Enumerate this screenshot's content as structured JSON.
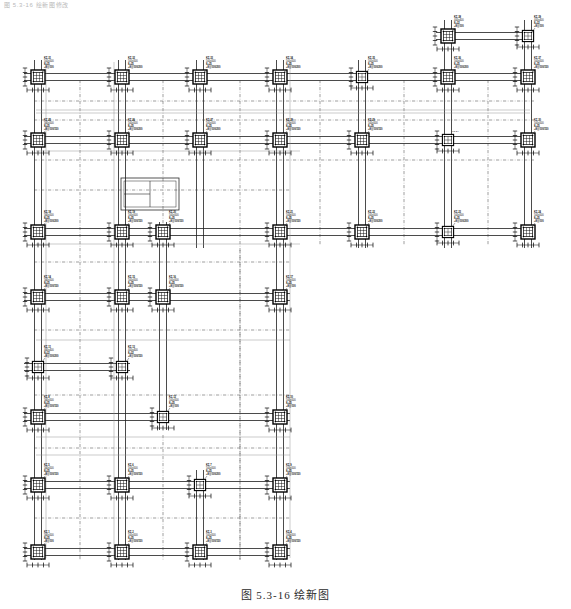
{
  "header": {
    "text": "图 5.3-16 绘新图修改"
  },
  "caption": {
    "text": "图 5.3-16  绘新图"
  },
  "drawing": {
    "type": "structural-column-layout-plan",
    "title": "柱平法施工图",
    "ink_color": "#111111",
    "grid_color": "#6b6b6b",
    "canvas": {
      "width": 571,
      "height": 609
    },
    "plan_bounds": {
      "x": 24,
      "y": 56,
      "width": 510,
      "height": 505
    },
    "column_size_default": "500x500",
    "column_size_small": "400x400",
    "column_x_lines": [
      38,
      122,
      200,
      280,
      362,
      448,
      528
    ],
    "column_y_lines": [
      77,
      140,
      232,
      297,
      367,
      417,
      485,
      552
    ],
    "column_marks": [
      {
        "id": "KZ-31",
        "size": "500x500",
        "rebar": "8⌀25",
        "stirrup": "⌀8@100",
        "x": 38,
        "y": 77,
        "lx": 44,
        "ly": 57,
        "big": true
      },
      {
        "id": "KZ-32",
        "size": "500x500",
        "rebar": "8⌀25",
        "stirrup": "⌀8@100/200",
        "x": 122,
        "y": 77,
        "lx": 128,
        "ly": 57,
        "big": true
      },
      {
        "id": "KZ-33",
        "size": "500x500",
        "rebar": "8⌀25",
        "stirrup": "⌀8@100/200",
        "x": 200,
        "y": 77,
        "lx": 206,
        "ly": 57,
        "big": true
      },
      {
        "id": "KZ-34",
        "size": "500x500",
        "rebar": "8⌀25",
        "stirrup": "⌀8@100/200",
        "x": 280,
        "y": 77,
        "lx": 286,
        "ly": 57,
        "big": true
      },
      {
        "id": "KZ-35",
        "size": "500x500",
        "rebar": "8⌀25",
        "stirrup": "⌀8@100/200",
        "x": 362,
        "y": 77,
        "lx": 368,
        "ly": 57,
        "big": false
      },
      {
        "id": "KZ-36",
        "size": "500x500",
        "rebar": "8⌀25",
        "stirrup": "⌀8@100/200",
        "x": 448,
        "y": 77,
        "lx": 454,
        "ly": 57,
        "big": true
      },
      {
        "id": "KZ-37",
        "size": "500x500",
        "rebar": "8⌀25",
        "stirrup": "⌀8@100/150",
        "x": 528,
        "y": 77,
        "lx": 534,
        "ly": 57,
        "big": true
      },
      {
        "id": "KZ-38",
        "size": "400x400",
        "rebar": "8⌀22",
        "stirrup": "⌀8@100",
        "x": 448,
        "y": 36,
        "lx": 454,
        "ly": 16,
        "big": true
      },
      {
        "id": "KZ-39",
        "size": "400x400",
        "rebar": "8⌀22",
        "stirrup": "⌀8@100",
        "x": 528,
        "y": 36,
        "lx": 534,
        "ly": 16,
        "big": false
      },
      {
        "id": "KZ-25",
        "size": "500x500",
        "rebar": "8⌀25",
        "stirrup": "⌀8@100/150",
        "x": 38,
        "y": 140,
        "lx": 44,
        "ly": 119,
        "big": true
      },
      {
        "id": "KZ-26",
        "size": "500x500",
        "rebar": "8⌀25",
        "stirrup": "⌀8@100/200",
        "x": 122,
        "y": 140,
        "lx": 128,
        "ly": 119,
        "big": true
      },
      {
        "id": "KZ-27",
        "size": "500x500",
        "rebar": "8⌀25",
        "stirrup": "⌀8@100/200",
        "x": 200,
        "y": 140,
        "lx": 206,
        "ly": 119,
        "big": true
      },
      {
        "id": "KZ-28",
        "size": "500x500",
        "rebar": "8⌀25",
        "stirrup": "⌀8@100/150",
        "x": 280,
        "y": 140,
        "lx": 286,
        "ly": 119,
        "big": true
      },
      {
        "id": "KZ-29",
        "size": "500x500",
        "rebar": "8⌀25",
        "stirrup": "⌀8@100/150",
        "x": 362,
        "y": 140,
        "lx": 368,
        "ly": 119,
        "big": true
      },
      {
        "id": "KZ-24",
        "size": "",
        "rebar": "",
        "stirrup": "",
        "x": 448,
        "y": 140,
        "lx": 452,
        "ly": 131,
        "big": false
      },
      {
        "id": "KZ-30",
        "size": "500x500",
        "rebar": "8⌀25",
        "stirrup": "⌀8@100/150",
        "x": 528,
        "y": 140,
        "lx": 534,
        "ly": 119,
        "big": true
      },
      {
        "id": "KZ-18",
        "size": "500x500",
        "rebar": "8⌀25",
        "stirrup": "⌀8@100/200",
        "x": 38,
        "y": 232,
        "lx": 44,
        "ly": 211,
        "big": true
      },
      {
        "id": "KZ-19",
        "size": "500x500",
        "rebar": "8⌀25",
        "stirrup": "⌀8@100/150",
        "x": 122,
        "y": 232,
        "lx": 128,
        "ly": 211,
        "big": true
      },
      {
        "id": "KZ-20",
        "size": "500x500",
        "rebar": "8⌀25",
        "stirrup": "⌀8@100/150",
        "x": 163,
        "y": 232,
        "lx": 169,
        "ly": 211,
        "big": true
      },
      {
        "id": "KZ-21",
        "size": "500x500",
        "rebar": "8⌀25",
        "stirrup": "⌀8@100/150",
        "x": 280,
        "y": 232,
        "lx": 286,
        "ly": 211,
        "big": true
      },
      {
        "id": "KZ-22",
        "size": "500x500",
        "rebar": "8⌀25",
        "stirrup": "⌀8@100/200",
        "x": 362,
        "y": 232,
        "lx": 368,
        "ly": 211,
        "big": true
      },
      {
        "id": "KZ-23",
        "size": "500x500",
        "rebar": "8⌀25",
        "stirrup": "⌀8@100/200",
        "x": 448,
        "y": 232,
        "lx": 454,
        "ly": 211,
        "big": false
      },
      {
        "id": "KZ-24b",
        "size": "500x500",
        "rebar": "8⌀25",
        "stirrup": "⌀8@100",
        "x": 528,
        "y": 232,
        "lx": 534,
        "ly": 211,
        "big": true
      },
      {
        "id": "KZ-14",
        "size": "500x500",
        "rebar": "8⌀25",
        "stirrup": "⌀8@100/150",
        "x": 38,
        "y": 297,
        "lx": 44,
        "ly": 276,
        "big": true
      },
      {
        "id": "KZ-15",
        "size": "500x500",
        "rebar": "8⌀25",
        "stirrup": "⌀8@100/150",
        "x": 122,
        "y": 297,
        "lx": 128,
        "ly": 276,
        "big": true
      },
      {
        "id": "KZ-16",
        "size": "500x500",
        "rebar": "8⌀25",
        "stirrup": "⌀8@100/150",
        "x": 163,
        "y": 297,
        "lx": 169,
        "ly": 276,
        "big": true
      },
      {
        "id": "KZ-17",
        "size": "500x500",
        "rebar": "8⌀25",
        "stirrup": "⌀8@100",
        "x": 280,
        "y": 297,
        "lx": 286,
        "ly": 276,
        "big": true
      },
      {
        "id": "KZ-11",
        "size": "400x400",
        "rebar": "8⌀22",
        "stirrup": "⌀8@100/200",
        "x": 38,
        "y": 367,
        "lx": 44,
        "ly": 346,
        "big": false
      },
      {
        "id": "KZ-13",
        "size": "400x400",
        "rebar": "8⌀22",
        "stirrup": "⌀8@100/150",
        "x": 122,
        "y": 367,
        "lx": 128,
        "ly": 346,
        "big": false
      },
      {
        "id": "KZ-8",
        "size": "500x500",
        "rebar": "8⌀25",
        "stirrup": "⌀8@100/150",
        "x": 38,
        "y": 417,
        "lx": 44,
        "ly": 396,
        "big": true
      },
      {
        "id": "KZ-12",
        "size": "500x500",
        "rebar": "8⌀25",
        "stirrup": "⌀8@100",
        "x": 163,
        "y": 417,
        "lx": 169,
        "ly": 396,
        "big": false
      },
      {
        "id": "KZ-10",
        "size": "500x500",
        "rebar": "8⌀25",
        "stirrup": "⌀8@100",
        "x": 280,
        "y": 417,
        "lx": 286,
        "ly": 396,
        "big": true
      },
      {
        "id": "KZ-5",
        "size": "500x500",
        "rebar": "8⌀25",
        "stirrup": "⌀8@100/150",
        "x": 38,
        "y": 485,
        "lx": 44,
        "ly": 464,
        "big": true
      },
      {
        "id": "KZ-6",
        "size": "500x500",
        "rebar": "8⌀25",
        "stirrup": "⌀8@100/150",
        "x": 122,
        "y": 485,
        "lx": 128,
        "ly": 464,
        "big": true
      },
      {
        "id": "KZ-7",
        "size": "500x500",
        "rebar": "8⌀25",
        "stirrup": "⌀8@100/200",
        "x": 200,
        "y": 485,
        "lx": 206,
        "ly": 464,
        "big": false
      },
      {
        "id": "KZ-9",
        "size": "500x500",
        "rebar": "8⌀25",
        "stirrup": "⌀8@100/150",
        "x": 280,
        "y": 485,
        "lx": 286,
        "ly": 464,
        "big": true
      },
      {
        "id": "KZ-1",
        "size": "500x500",
        "rebar": "8⌀25",
        "stirrup": "⌀8@100",
        "x": 38,
        "y": 552,
        "lx": 44,
        "ly": 531,
        "big": true
      },
      {
        "id": "KZ-2",
        "size": "500x500",
        "rebar": "8⌀25",
        "stirrup": "⌀8@100/150",
        "x": 122,
        "y": 552,
        "lx": 128,
        "ly": 531,
        "big": true
      },
      {
        "id": "KZ-3",
        "size": "500x500",
        "rebar": "8⌀25",
        "stirrup": "⌀8@100/150",
        "x": 200,
        "y": 552,
        "lx": 206,
        "ly": 531,
        "big": true
      },
      {
        "id": "KZ-4",
        "size": "500x500",
        "rebar": "8⌀25",
        "stirrup": "⌀8@100/150",
        "x": 280,
        "y": 552,
        "lx": 286,
        "ly": 531,
        "big": true
      }
    ]
  }
}
